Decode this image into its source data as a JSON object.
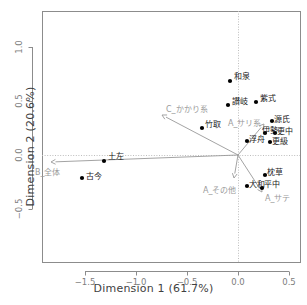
{
  "chart_data": {
    "type": "scatter",
    "title": "",
    "xlabel": "Dimension 1  (61.7%)",
    "ylabel": "Dimension 2  (20.6%)",
    "xlim": [
      -1.85,
      0.62
    ],
    "ylim": [
      -0.82,
      1.25
    ],
    "xticks": [
      -1.5,
      -1.0,
      -0.5,
      0.0,
      0.5
    ],
    "xticklabels": [
      "−1.5",
      "−1.0",
      "−0.5",
      "0.0",
      "0.5"
    ],
    "yticks": [
      1.0,
      0.5,
      0.0,
      -0.5
    ],
    "yticklabels": [
      "1.0",
      "0.5",
      "0.0",
      "−0.5"
    ],
    "grid": false,
    "legend": "none",
    "point_color": "#000000",
    "vector_color": "#999999",
    "axis_color": "#8c8c8c",
    "points": [
      {
        "label": "和泉",
        "x": -0.03,
        "y": 0.685,
        "px": 230,
        "py": 81,
        "lx": 234,
        "ly": 70
      },
      {
        "label": "讃岐",
        "x": -0.05,
        "y": 0.465,
        "px": 228,
        "py": 105,
        "lx": 232,
        "ly": 95
      },
      {
        "label": "紫式",
        "x": 0.22,
        "y": 0.495,
        "px": 256,
        "py": 102,
        "lx": 260,
        "ly": 92
      },
      {
        "label": "源氏",
        "x": 0.33,
        "y": 0.315,
        "px": 272,
        "py": 121,
        "lx": 274,
        "ly": 113
      },
      {
        "label": "伊勢",
        "x": 0.27,
        "y": 0.205,
        "px": 265,
        "py": 133,
        "lx": 262,
        "ly": 124
      },
      {
        "label": "更中",
        "x": 0.36,
        "y": 0.205,
        "px": 275,
        "py": 133,
        "lx": 277,
        "ly": 125
      },
      {
        "label": "更級",
        "x": 0.31,
        "y": 0.125,
        "px": 270,
        "py": 142,
        "lx": 272,
        "ly": 135
      },
      {
        "label": "浮舟",
        "x": 0.09,
        "y": 0.135,
        "px": 247,
        "py": 141,
        "lx": 249,
        "ly": 133
      },
      {
        "label": "竹取",
        "x": -0.35,
        "y": 0.255,
        "px": 202,
        "py": 128,
        "lx": 205,
        "ly": 118
      },
      {
        "label": "土左",
        "x": -1.22,
        "y": -0.06,
        "px": 104,
        "py": 161,
        "lx": 108,
        "ly": 150
      },
      {
        "label": "古今",
        "x": -1.42,
        "y": -0.21,
        "px": 82,
        "py": 178,
        "lx": 86,
        "ly": 170
      },
      {
        "label": "枕草",
        "x": 0.27,
        "y": -0.18,
        "px": 265,
        "py": 175,
        "lx": 267,
        "ly": 166
      },
      {
        "label": "大和",
        "x": 0.1,
        "y": -0.28,
        "px": 247,
        "py": 186,
        "lx": 249,
        "ly": 178
      },
      {
        "label": "平中",
        "x": 0.23,
        "y": -0.3,
        "px": 262,
        "py": 188,
        "lx": 264,
        "ly": 178
      }
    ],
    "vectors": [
      {
        "label": "C_かかり系",
        "x": -0.7,
        "y": 0.38,
        "px": 162,
        "py": 115,
        "lx": 166,
        "ly": 103
      },
      {
        "label": "B_全体",
        "x": -1.7,
        "y": -0.04,
        "px": 51,
        "py": 162,
        "lx": 35,
        "ly": 166
      },
      {
        "label": "A_サリ系",
        "x": 0.27,
        "y": 0.285,
        "px": 264,
        "py": 124,
        "lx": 228,
        "ly": 117
      },
      {
        "label": "A_その他",
        "x": -0.03,
        "y": -0.21,
        "px": 234,
        "py": 178,
        "lx": 203,
        "ly": 184
      },
      {
        "label": "A_サテ",
        "x": 0.24,
        "y": -0.33,
        "px": 262,
        "py": 192,
        "lx": 265,
        "ly": 192
      }
    ],
    "origin": {
      "px": 238,
      "py": 155
    },
    "panel": {
      "left": 42,
      "top": 11,
      "right": 300,
      "bottom": 262
    }
  }
}
